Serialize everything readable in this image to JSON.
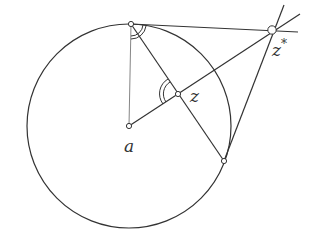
{
  "diagram": {
    "circle": {
      "center": [
        129,
        126
      ],
      "radius": 102
    },
    "points": {
      "a": {
        "label": "a",
        "xy": [
          129,
          126
        ]
      },
      "z": {
        "label": "z",
        "xy": [
          178,
          94
        ]
      },
      "z_star": {
        "label": "z",
        "sup": "*",
        "xy": [
          272,
          30
        ]
      },
      "t1": {
        "xy": [
          131,
          24
        ]
      },
      "t2": {
        "xy": [
          224,
          161
        ]
      }
    },
    "colors": {
      "stroke": "#333333",
      "thin": "#555555",
      "point_fill": "#ffffff"
    }
  }
}
